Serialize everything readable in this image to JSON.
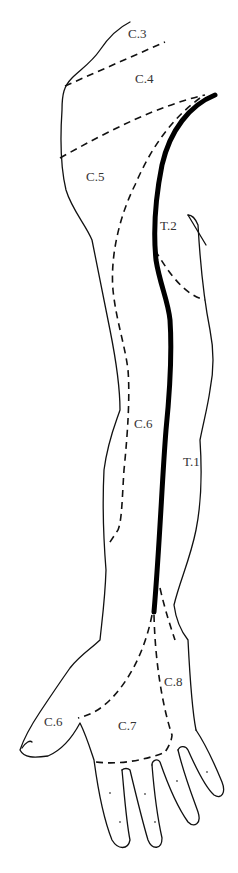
{
  "diagram": {
    "labels": {
      "c3": "C.3",
      "c4": "C.4",
      "c5": "C.5",
      "t2": "T.2",
      "c6_arm": "C.6",
      "t1": "T.1",
      "c8": "C.8",
      "c6_thumb": "C.6",
      "c7": "C.7"
    },
    "colors": {
      "line": "#111111",
      "background": "#ffffff",
      "label": "#333333"
    },
    "legend": {
      "thick_line": "axial line",
      "dashed_line": "dermatome boundary"
    }
  }
}
